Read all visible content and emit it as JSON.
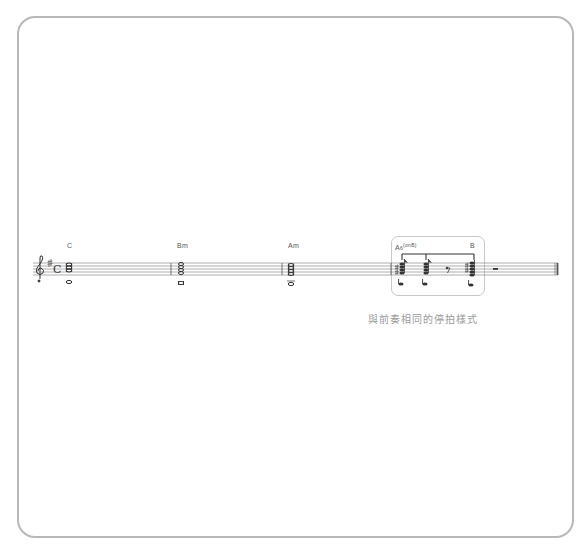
{
  "score": {
    "key_signature": "G major (1 sharp)",
    "time_signature": "C",
    "clef": "treble",
    "measures": [
      {
        "index": 1,
        "chord": "C",
        "content": "whole-note chord"
      },
      {
        "index": 2,
        "chord": "Bm",
        "content": "whole-note chord"
      },
      {
        "index": 3,
        "chord": "Am",
        "content": "whole-note chord"
      },
      {
        "index": 4,
        "chord": "A6",
        "chord_sup": "(onB)",
        "chord2": "B",
        "content": "stop-beat rhythm: eighth chords, eighth rest, chord, half rest"
      }
    ],
    "labels": {
      "m1": "C",
      "m2": "Bm",
      "m3": "Am",
      "m4_main": "A",
      "m4_num": "6",
      "m4_sup": "(onB)",
      "m4_second": "B"
    },
    "annotation": {
      "caption": "與前奏相同的停拍樣式"
    },
    "colors": {
      "frame": "#b8b8b8",
      "staff": "#8a8a8a",
      "notes": "#333333",
      "caption": "#9a9a9a",
      "highlight_border": "#c8c8c8"
    }
  }
}
